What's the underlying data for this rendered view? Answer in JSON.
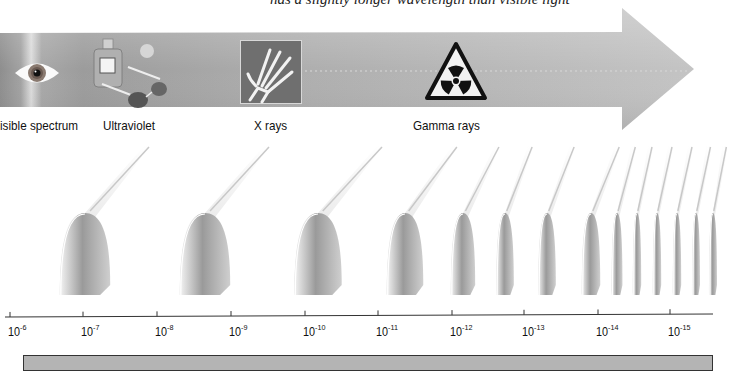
{
  "top_caption": "has a slightly longer wavelength than visible light",
  "arrow": {
    "color": "#b8b8b8",
    "bands": [
      {
        "label": "isible spectrum",
        "icon": "eye-icon",
        "x": 0
      },
      {
        "label": "Ultraviolet",
        "icon": "sunscreen-sunglasses-icon",
        "x": 103
      },
      {
        "label": "X rays",
        "icon": "xray-hand-icon",
        "x": 254
      },
      {
        "label": "Gamma rays",
        "icon": "radiation-warning-icon",
        "x": 413
      }
    ]
  },
  "axis": {
    "ticks": [
      {
        "base": "10",
        "exp": "-6",
        "x": 10
      },
      {
        "base": "10",
        "exp": "-7",
        "x": 83
      },
      {
        "base": "10",
        "exp": "-8",
        "x": 157
      },
      {
        "base": "10",
        "exp": "-9",
        "x": 231
      },
      {
        "base": "10",
        "exp": "-10",
        "x": 305
      },
      {
        "base": "10",
        "exp": "-11",
        "x": 378
      },
      {
        "base": "10",
        "exp": "-12",
        "x": 452
      },
      {
        "base": "10",
        "exp": "-13",
        "x": 524
      },
      {
        "base": "10",
        "exp": "-14",
        "x": 598
      },
      {
        "base": "10",
        "exp": "-15",
        "x": 670
      }
    ]
  },
  "wave": {
    "crests_x": [
      85,
      205,
      318,
      405,
      463,
      505,
      547,
      591,
      617,
      637,
      657,
      677,
      696,
      713
    ]
  },
  "bottom_bar": {
    "color": "#b4b4b4"
  }
}
